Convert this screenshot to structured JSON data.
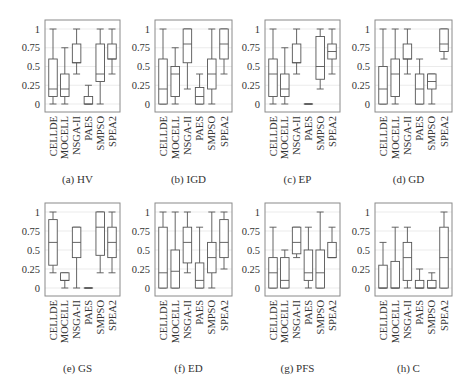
{
  "figure": {
    "layout": {
      "rows": 2,
      "cols": 4
    },
    "colors": {
      "frame": "#8a8a8a",
      "box": "#555555",
      "grid": "#e2e2e2",
      "text": "#333333"
    }
  },
  "chart_data": [
    {
      "type": "box",
      "label": "(a)",
      "title": "HV",
      "caption": "(a) HV",
      "categories": [
        "CELLDE",
        "MOCELL",
        "NSGA-II",
        "PAES",
        "SMPSO",
        "SPEA2"
      ],
      "yticks": [
        "0",
        "0.25",
        "0.5",
        "0.75",
        "1"
      ],
      "ylim": [
        0,
        1
      ],
      "grid": true,
      "boxes": [
        {
          "min": 0.0,
          "q1": 0.1,
          "median": 0.2,
          "q3": 0.6,
          "max": 1.0
        },
        {
          "min": 0.0,
          "q1": 0.1,
          "median": 0.2,
          "q3": 0.4,
          "max": 0.75
        },
        {
          "min": 0.4,
          "q1": 0.55,
          "median": 0.55,
          "q3": 0.8,
          "max": 1.0
        },
        {
          "min": 0.0,
          "q1": 0.0,
          "median": 0.0,
          "q3": 0.1,
          "max": 0.25
        },
        {
          "min": 0.0,
          "q1": 0.3,
          "median": 0.4,
          "q3": 0.8,
          "max": 1.0
        },
        {
          "min": 0.4,
          "q1": 0.6,
          "median": 0.6,
          "q3": 0.8,
          "max": 1.0
        }
      ]
    },
    {
      "type": "box",
      "label": "(b)",
      "title": "IGD",
      "caption": "(b) IGD",
      "categories": [
        "CELLDE",
        "MOCELL",
        "NSGA-II",
        "PAES",
        "SMPSO",
        "SPEA2"
      ],
      "yticks": [
        "0",
        "0.25",
        "0.5",
        "0.75",
        "1"
      ],
      "ylim": [
        0,
        1
      ],
      "grid": true,
      "boxes": [
        {
          "min": 0.0,
          "q1": 0.0,
          "median": 0.2,
          "q3": 0.6,
          "max": 1.0
        },
        {
          "min": 0.0,
          "q1": 0.1,
          "median": 0.4,
          "q3": 0.5,
          "max": 0.75
        },
        {
          "min": 0.2,
          "q1": 0.55,
          "median": 0.8,
          "q3": 1.0,
          "max": 1.0
        },
        {
          "min": 0.0,
          "q1": 0.0,
          "median": 0.1,
          "q3": 0.22,
          "max": 0.4
        },
        {
          "min": 0.0,
          "q1": 0.2,
          "median": 0.4,
          "q3": 0.6,
          "max": 1.0
        },
        {
          "min": 0.4,
          "q1": 0.6,
          "median": 0.8,
          "q3": 1.0,
          "max": 1.0
        }
      ]
    },
    {
      "type": "box",
      "label": "(c)",
      "title": "EP",
      "caption": "(c) EP",
      "categories": [
        "CELLDE",
        "MOCELL",
        "NSGA-II",
        "PAES",
        "SMPSO",
        "SPEA2"
      ],
      "yticks": [
        "0",
        "0.25",
        "0.5",
        "0.75",
        "1"
      ],
      "ylim": [
        0,
        1
      ],
      "grid": true,
      "boxes": [
        {
          "min": 0.0,
          "q1": 0.1,
          "median": 0.4,
          "q3": 0.6,
          "max": 1.0
        },
        {
          "min": 0.0,
          "q1": 0.1,
          "median": 0.2,
          "q3": 0.4,
          "max": 0.75
        },
        {
          "min": 0.4,
          "q1": 0.55,
          "median": 0.55,
          "q3": 0.8,
          "max": 1.0
        },
        {
          "min": 0.0,
          "q1": 0.0,
          "median": 0.0,
          "q3": 0.0,
          "max": 0.0
        },
        {
          "min": 0.2,
          "q1": 0.33,
          "median": 0.5,
          "q3": 0.9,
          "max": 1.0
        },
        {
          "min": 0.4,
          "q1": 0.6,
          "median": 0.7,
          "q3": 0.8,
          "max": 1.0
        }
      ]
    },
    {
      "type": "box",
      "label": "(d)",
      "title": "GD",
      "caption": "(d) GD",
      "categories": [
        "CELLDE",
        "MOCELL",
        "NSGA-II",
        "PAES",
        "SMPSO",
        "SPEA2"
      ],
      "yticks": [
        "0",
        "0.25",
        "0.5",
        "0.75",
        "1"
      ],
      "ylim": [
        0,
        1
      ],
      "grid": true,
      "boxes": [
        {
          "min": 0.0,
          "q1": 0.0,
          "median": 0.2,
          "q3": 0.5,
          "max": 1.0
        },
        {
          "min": 0.0,
          "q1": 0.1,
          "median": 0.4,
          "q3": 0.6,
          "max": 1.0
        },
        {
          "min": 0.4,
          "q1": 0.6,
          "median": 0.6,
          "q3": 0.8,
          "max": 1.0
        },
        {
          "min": 0.0,
          "q1": 0.0,
          "median": 0.2,
          "q3": 0.4,
          "max": 0.6
        },
        {
          "min": 0.0,
          "q1": 0.2,
          "median": 0.3,
          "q3": 0.4,
          "max": 0.4
        },
        {
          "min": 0.6,
          "q1": 0.7,
          "median": 0.8,
          "q3": 1.0,
          "max": 1.0
        }
      ]
    },
    {
      "type": "box",
      "label": "(e)",
      "title": "GS",
      "caption": "(e) GS",
      "categories": [
        "CELLDE",
        "MOCELL",
        "NSGA-II",
        "PAES",
        "SMPSO",
        "SPEA2"
      ],
      "yticks": [
        "0",
        "0.25",
        "0.5",
        "0.75",
        "1"
      ],
      "ylim": [
        0,
        1
      ],
      "grid": true,
      "boxes": [
        {
          "min": 0.2,
          "q1": 0.3,
          "median": 0.6,
          "q3": 0.9,
          "max": 1.0
        },
        {
          "min": 0.0,
          "q1": 0.1,
          "median": 0.1,
          "q3": 0.2,
          "max": 0.2
        },
        {
          "min": 0.0,
          "q1": 0.4,
          "median": 0.6,
          "q3": 0.8,
          "max": 0.8
        },
        {
          "min": 0.0,
          "q1": 0.0,
          "median": 0.0,
          "q3": 0.0,
          "max": 0.0
        },
        {
          "min": 0.2,
          "q1": 0.43,
          "median": 0.8,
          "q3": 1.0,
          "max": 1.0
        },
        {
          "min": 0.2,
          "q1": 0.4,
          "median": 0.6,
          "q3": 0.8,
          "max": 1.0
        }
      ]
    },
    {
      "type": "box",
      "label": "(f)",
      "title": "ED",
      "caption": "(f) ED",
      "categories": [
        "CELLDE",
        "MOCELL",
        "NSGA-II",
        "PAES",
        "SMPSO",
        "SPEA2"
      ],
      "yticks": [
        "0",
        "0.25",
        "0.5",
        "0.75",
        "1"
      ],
      "ylim": [
        0,
        1
      ],
      "grid": true,
      "boxes": [
        {
          "min": 0.0,
          "q1": 0.0,
          "median": 0.2,
          "q3": 0.8,
          "max": 1.0
        },
        {
          "min": 0.0,
          "q1": 0.0,
          "median": 0.22,
          "q3": 0.5,
          "max": 1.0
        },
        {
          "min": 0.2,
          "q1": 0.33,
          "median": 0.6,
          "q3": 0.8,
          "max": 1.0
        },
        {
          "min": 0.0,
          "q1": 0.0,
          "median": 0.1,
          "q3": 0.33,
          "max": 0.8
        },
        {
          "min": 0.0,
          "q1": 0.2,
          "median": 0.4,
          "q3": 0.6,
          "max": 1.0
        },
        {
          "min": 0.25,
          "q1": 0.4,
          "median": 0.6,
          "q3": 0.9,
          "max": 1.0
        }
      ]
    },
    {
      "type": "box",
      "label": "(g)",
      "title": "PFS",
      "caption": "(g) PFS",
      "categories": [
        "CELLDE",
        "MOCELL",
        "NSGA-II",
        "PAES",
        "SMPSO",
        "SPEA2"
      ],
      "yticks": [
        "0",
        "0.25",
        "0.5",
        "0.75",
        "1"
      ],
      "ylim": [
        0,
        1
      ],
      "grid": true,
      "boxes": [
        {
          "min": 0.0,
          "q1": 0.0,
          "median": 0.2,
          "q3": 0.4,
          "max": 0.8
        },
        {
          "min": 0.0,
          "q1": 0.0,
          "median": 0.1,
          "q3": 0.4,
          "max": 0.5
        },
        {
          "min": 0.4,
          "q1": 0.45,
          "median": 0.6,
          "q3": 0.8,
          "max": 0.8
        },
        {
          "min": 0.0,
          "q1": 0.1,
          "median": 0.2,
          "q3": 0.5,
          "max": 0.8
        },
        {
          "min": 0.0,
          "q1": 0.0,
          "median": 0.2,
          "q3": 0.5,
          "max": 1.0
        },
        {
          "min": 0.4,
          "q1": 0.4,
          "median": 0.4,
          "q3": 0.6,
          "max": 0.8
        }
      ]
    },
    {
      "type": "box",
      "label": "(h)",
      "title": "C",
      "caption": "(h) C",
      "categories": [
        "CELLDE",
        "MOCELL",
        "NSGA-II",
        "PAES",
        "SMPSO",
        "SPEA2"
      ],
      "yticks": [
        "0",
        "0.25",
        "0.5",
        "0.75",
        "1"
      ],
      "ylim": [
        0,
        1
      ],
      "grid": true,
      "boxes": [
        {
          "min": 0.0,
          "q1": 0.0,
          "median": 0.0,
          "q3": 0.3,
          "max": 0.6
        },
        {
          "min": 0.0,
          "q1": 0.0,
          "median": 0.0,
          "q3": 0.35,
          "max": 0.8
        },
        {
          "min": 0.0,
          "q1": 0.1,
          "median": 0.4,
          "q3": 0.6,
          "max": 0.8
        },
        {
          "min": 0.0,
          "q1": 0.0,
          "median": 0.0,
          "q3": 0.1,
          "max": 0.25
        },
        {
          "min": 0.0,
          "q1": 0.0,
          "median": 0.0,
          "q3": 0.1,
          "max": 0.2
        },
        {
          "min": 0.0,
          "q1": 0.0,
          "median": 0.4,
          "q3": 0.8,
          "max": 1.0
        }
      ]
    }
  ]
}
